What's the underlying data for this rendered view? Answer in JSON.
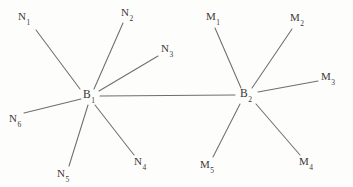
{
  "figure": {
    "type": "node-link-diagram",
    "background_color": "#fdfdfc",
    "bond_color": "#6e6e6e",
    "label_color": "#3a3a3a",
    "width": 353,
    "height": 187
  },
  "centers": [
    {
      "id": "B1",
      "symbol": "B",
      "subscript": "1",
      "x": 89,
      "y": 96
    },
    {
      "id": "B2",
      "symbol": "B",
      "subscript": "2",
      "x": 246,
      "y": 95
    }
  ],
  "ligands": [
    {
      "id": "N1",
      "symbol": "N",
      "subscript": "1",
      "x": 24,
      "y": 18,
      "attached_to": "B1",
      "line": {
        "x1": 36,
        "x2": 80,
        "y1": 30,
        "y2": 89
      }
    },
    {
      "id": "N2",
      "symbol": "N",
      "subscript": "2",
      "x": 127,
      "y": 14,
      "attached_to": "B1",
      "line": {
        "x1": 123,
        "x2": 94,
        "y1": 23,
        "y2": 89
      }
    },
    {
      "id": "N3",
      "symbol": "N",
      "subscript": "3",
      "x": 167,
      "y": 50,
      "attached_to": "B1",
      "line": {
        "x1": 158,
        "x2": 99,
        "y1": 56,
        "y2": 91
      }
    },
    {
      "id": "N4",
      "symbol": "N",
      "subscript": "4",
      "x": 140,
      "y": 163,
      "attached_to": "B1",
      "line": {
        "x1": 134,
        "x2": 95,
        "y1": 155,
        "y2": 105
      }
    },
    {
      "id": "N5",
      "symbol": "N",
      "subscript": "5",
      "x": 63,
      "y": 175,
      "attached_to": "B1",
      "line": {
        "x1": 69,
        "x2": 88,
        "y1": 166,
        "y2": 105
      }
    },
    {
      "id": "N6",
      "symbol": "N",
      "subscript": "6",
      "x": 15,
      "y": 120,
      "attached_to": "B1",
      "line": {
        "x1": 24,
        "x2": 81,
        "y1": 113,
        "y2": 99
      }
    },
    {
      "id": "M1",
      "symbol": "M",
      "subscript": "1",
      "x": 213,
      "y": 18,
      "attached_to": "B2",
      "line": {
        "x1": 215,
        "x2": 241,
        "y1": 28,
        "y2": 88
      }
    },
    {
      "id": "M2",
      "symbol": "M",
      "subscript": "2",
      "x": 297,
      "y": 19,
      "attached_to": "B2",
      "line": {
        "x1": 292,
        "x2": 252,
        "y1": 29,
        "y2": 88
      }
    },
    {
      "id": "M3",
      "symbol": "M",
      "subscript": "3",
      "x": 328,
      "y": 78,
      "attached_to": "B2",
      "line": {
        "x1": 318,
        "x2": 258,
        "y1": 81,
        "y2": 92
      }
    },
    {
      "id": "M4",
      "symbol": "M",
      "subscript": "4",
      "x": 306,
      "y": 163,
      "attached_to": "B2",
      "line": {
        "x1": 300,
        "x2": 256,
        "y1": 155,
        "y2": 104
      }
    },
    {
      "id": "M5",
      "symbol": "M",
      "subscript": "5",
      "x": 207,
      "y": 166,
      "attached_to": "B2",
      "line": {
        "x1": 213,
        "x2": 240,
        "y1": 157,
        "y2": 104
      }
    }
  ],
  "bonds": [
    {
      "id": "B1-B2",
      "from": "B1",
      "to": "B2",
      "line": {
        "x1": 100,
        "x2": 235,
        "y1": 96,
        "y2": 95
      }
    }
  ]
}
